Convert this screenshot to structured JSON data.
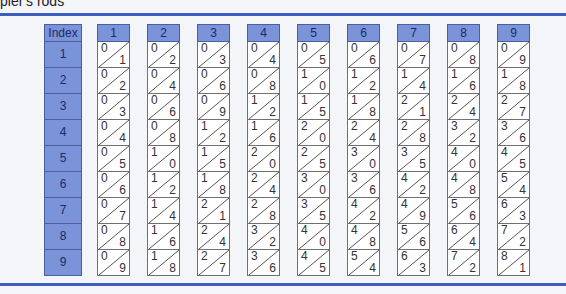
{
  "title": "pier's rods",
  "colors": {
    "accent_rule": "#3d5cc0",
    "header_fill": "#7b93d8",
    "header_text": "#1a2a6a",
    "cell_border": "#707070"
  },
  "index_column": {
    "header": "Index",
    "rows": [
      "1",
      "2",
      "3",
      "4",
      "5",
      "6",
      "7",
      "8",
      "9"
    ]
  },
  "rods": [
    {
      "header": "1",
      "cells": [
        [
          "0",
          "1"
        ],
        [
          "0",
          "2"
        ],
        [
          "0",
          "3"
        ],
        [
          "0",
          "4"
        ],
        [
          "0",
          "5"
        ],
        [
          "0",
          "6"
        ],
        [
          "0",
          "7"
        ],
        [
          "0",
          "8"
        ],
        [
          "0",
          "9"
        ]
      ]
    },
    {
      "header": "2",
      "cells": [
        [
          "0",
          "2"
        ],
        [
          "0",
          "4"
        ],
        [
          "0",
          "6"
        ],
        [
          "0",
          "8"
        ],
        [
          "1",
          "0"
        ],
        [
          "1",
          "2"
        ],
        [
          "1",
          "4"
        ],
        [
          "1",
          "6"
        ],
        [
          "1",
          "8"
        ]
      ]
    },
    {
      "header": "3",
      "cells": [
        [
          "0",
          "3"
        ],
        [
          "0",
          "6"
        ],
        [
          "0",
          "9"
        ],
        [
          "1",
          "2"
        ],
        [
          "1",
          "5"
        ],
        [
          "1",
          "8"
        ],
        [
          "2",
          "1"
        ],
        [
          "2",
          "4"
        ],
        [
          "2",
          "7"
        ]
      ]
    },
    {
      "header": "4",
      "cells": [
        [
          "0",
          "4"
        ],
        [
          "0",
          "8"
        ],
        [
          "1",
          "2"
        ],
        [
          "1",
          "6"
        ],
        [
          "2",
          "0"
        ],
        [
          "2",
          "4"
        ],
        [
          "2",
          "8"
        ],
        [
          "3",
          "2"
        ],
        [
          "3",
          "6"
        ]
      ]
    },
    {
      "header": "5",
      "cells": [
        [
          "0",
          "5"
        ],
        [
          "1",
          "0"
        ],
        [
          "1",
          "5"
        ],
        [
          "2",
          "0"
        ],
        [
          "2",
          "5"
        ],
        [
          "3",
          "0"
        ],
        [
          "3",
          "5"
        ],
        [
          "4",
          "0"
        ],
        [
          "4",
          "5"
        ]
      ]
    },
    {
      "header": "6",
      "cells": [
        [
          "0",
          "6"
        ],
        [
          "1",
          "2"
        ],
        [
          "1",
          "8"
        ],
        [
          "2",
          "4"
        ],
        [
          "3",
          "0"
        ],
        [
          "3",
          "6"
        ],
        [
          "4",
          "2"
        ],
        [
          "4",
          "8"
        ],
        [
          "5",
          "4"
        ]
      ]
    },
    {
      "header": "7",
      "cells": [
        [
          "0",
          "7"
        ],
        [
          "1",
          "4"
        ],
        [
          "2",
          "1"
        ],
        [
          "2",
          "8"
        ],
        [
          "3",
          "5"
        ],
        [
          "4",
          "2"
        ],
        [
          "4",
          "9"
        ],
        [
          "5",
          "6"
        ],
        [
          "6",
          "3"
        ]
      ]
    },
    {
      "header": "8",
      "cells": [
        [
          "0",
          "8"
        ],
        [
          "1",
          "6"
        ],
        [
          "2",
          "4"
        ],
        [
          "3",
          "2"
        ],
        [
          "4",
          "0"
        ],
        [
          "4",
          "8"
        ],
        [
          "5",
          "6"
        ],
        [
          "6",
          "4"
        ],
        [
          "7",
          "2"
        ]
      ]
    },
    {
      "header": "9",
      "cells": [
        [
          "0",
          "9"
        ],
        [
          "1",
          "8"
        ],
        [
          "2",
          "7"
        ],
        [
          "3",
          "6"
        ],
        [
          "4",
          "5"
        ],
        [
          "5",
          "4"
        ],
        [
          "6",
          "3"
        ],
        [
          "7",
          "2"
        ],
        [
          "8",
          "1"
        ]
      ]
    }
  ]
}
